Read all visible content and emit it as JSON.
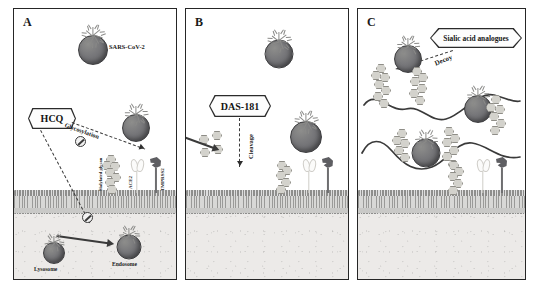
{
  "figure": {
    "background_color": "#ffffff",
    "panel_border_color": "#262626",
    "membrane_color": "#d8d8d6",
    "cytoplasm_color": "#eceae8",
    "virus_color": "#6a6a6e",
    "glycan_color": "#d3d2cc",
    "tmprss2_color": "#5e5e62",
    "ace2_color": "#cfcdc8"
  },
  "panels": [
    {
      "id": "A",
      "letter": "A",
      "labels": {
        "virus": "SARS-CoV-2",
        "drug": "HCQ",
        "mechanism": "Glycosylation",
        "glycan": "Sialylated glycan",
        "receptor": "ACE2",
        "protease": "TMPRSS2",
        "lysosome": "Lysosome",
        "endosome": "Endosome"
      }
    },
    {
      "id": "B",
      "letter": "B",
      "labels": {
        "drug": "DAS-181",
        "mechanism": "Cleavage",
        "receptor": "ACE2",
        "protease": "TMPRSS2"
      }
    },
    {
      "id": "C",
      "letter": "C",
      "labels": {
        "drug": "Sialic acid analogues",
        "mechanism": "Decoy",
        "receptor": "ACE2",
        "protease": "TMPRSS2"
      }
    }
  ]
}
